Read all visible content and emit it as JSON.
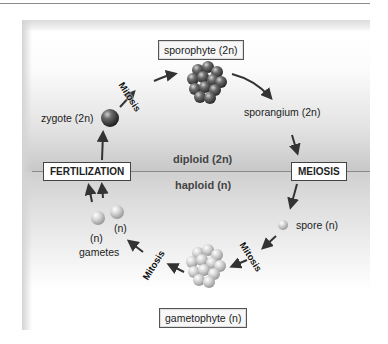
{
  "diagram": {
    "zones": {
      "upper": "diploid (2n)",
      "lower": "haploid (n)"
    },
    "process_boxes": {
      "fertilization": "FERTILIZATION",
      "meiosis": "MEIOSIS"
    },
    "stage_boxes": {
      "sporophyte": "sporophyte (2n)",
      "gametophyte": "gametophyte (n)"
    },
    "labels": {
      "zygote": "zygote (2n)",
      "sporangium": "sporangium (2n)",
      "spore": "spore (n)",
      "gamete_n_1": "(n)",
      "gamete_n_2": "(n)",
      "gametes": "gametes"
    },
    "arrow_labels": {
      "mitosis_top": "Mitosis",
      "mitosis_right": "Mitosis",
      "mitosis_left": "Mitosis"
    },
    "colors": {
      "diploid_band": "#c8c8c8",
      "divider": "#8c8c8c",
      "zygote_sphere": "#555555",
      "sporophyte_cluster": "#4a4a4a",
      "gametophyte_cluster": "#c9c9c9",
      "arrow": "#333333"
    }
  }
}
